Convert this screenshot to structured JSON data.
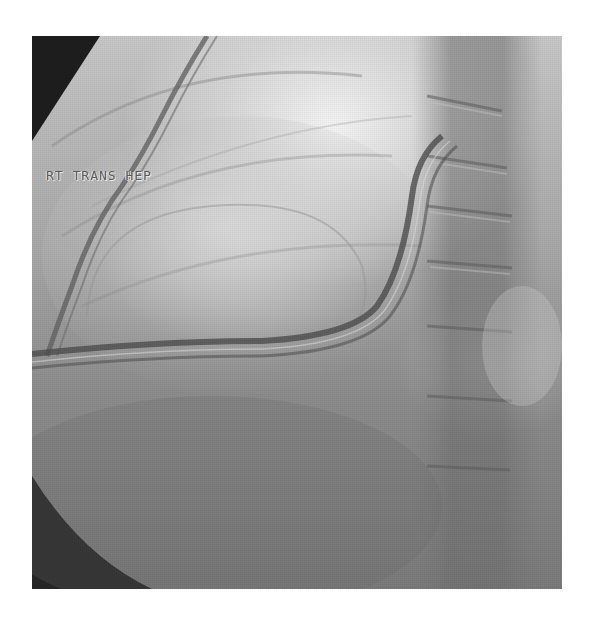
{
  "image": {
    "type": "fluoroscopy",
    "description": "Grayscale fluoroscopic image of the right upper abdomen showing a transhepatic catheter coursing through liver with spine on the right",
    "overlay_text": "RT TRANS HEP",
    "colors": {
      "background": "#ffffff",
      "collimator_dark": "#1e1e1e",
      "bright_region": "#f4f4f4",
      "mid_tissue": "#9a9a9a",
      "dark_tissue": "#6e6e6e",
      "catheter": "#5a5a5a",
      "label_text": "#5a5a5a"
    }
  }
}
